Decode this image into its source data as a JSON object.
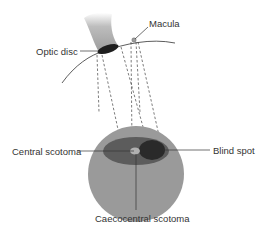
{
  "diagram": {
    "labels": {
      "macula": "Macula",
      "optic_disc": "Optic disc",
      "central_scotoma": "Central scotoma",
      "blind_spot": "Blind spot",
      "caecocentral_scotoma": "Caecocentral scotoma"
    },
    "colors": {
      "visual_field": "#9a9a9a",
      "caecocentral_region": "#5c5c5c",
      "blind_spot": "#2a2a2a",
      "central_spot": "#b0b0b0",
      "optic_nerve": "#a8a8a8",
      "optic_disc": "#1e1e1e",
      "lines": "#333333"
    }
  }
}
